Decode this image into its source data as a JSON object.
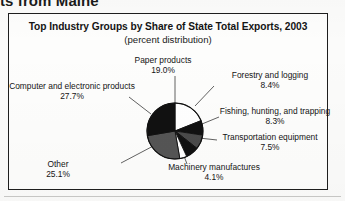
{
  "page": {
    "running_heading": "ts from Maine"
  },
  "figure": {
    "title": "Top Industry Groups by Share of State Total Exports, 2003",
    "subtitle": "(percent distribution)"
  },
  "chart_data": {
    "type": "pie",
    "title": "Top Industry Groups by Share of State Total Exports, 2003",
    "subtitle": "(percent distribution)",
    "xlabel": "",
    "ylabel": "",
    "value_suffix": "%",
    "legend_position": "callout-labels",
    "grid": false,
    "start_angle_deg": 0,
    "direction": "clockwise",
    "categories": [
      "Paper products",
      "Forestry and logging",
      "Fishing, hunting, and trapping",
      "Transportation equipment",
      "Machinery manufactures",
      "Other",
      "Computer and electronic products"
    ],
    "values": [
      19.0,
      8.4,
      8.3,
      7.5,
      4.1,
      25.1,
      27.7
    ],
    "slices": [
      {
        "label": "Paper products",
        "value": 19.0,
        "value_text": "19.0%",
        "color": "#ffffff",
        "edge": "#111111"
      },
      {
        "label": "Forestry and logging",
        "value": 8.4,
        "value_text": "8.4%",
        "color": "#111111",
        "edge": "#111111"
      },
      {
        "label": "Fishing, hunting, and trapping",
        "value": 8.3,
        "value_text": "8.3%",
        "color": "#4a4a4a",
        "edge": "#111111"
      },
      {
        "label": "Transportation equipment",
        "value": 7.5,
        "value_text": "7.5%",
        "color": "#111111",
        "edge": "#111111"
      },
      {
        "label": "Machinery manufactures",
        "value": 4.1,
        "value_text": "4.1%",
        "color": "#ffffff",
        "edge": "#111111"
      },
      {
        "label": "Other",
        "value": 25.1,
        "value_text": "25.1%",
        "color": "#555555",
        "edge": "#111111"
      },
      {
        "label": "Computer and electronic products",
        "value": 27.7,
        "value_text": "27.7%",
        "color": "#111111",
        "edge": "#111111"
      }
    ]
  }
}
